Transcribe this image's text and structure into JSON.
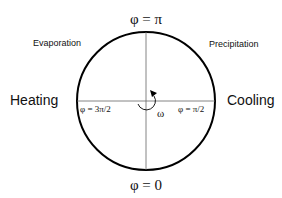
{
  "labels": {
    "top": "φ = π",
    "bottom": "φ = 0",
    "left_inner": "φ = 3π/2",
    "right_inner": "φ = π/2",
    "omega": "ω",
    "heating": "Heating",
    "cooling": "Cooling",
    "evaporation": "Evaporation",
    "precipitation": "Precipitation"
  }
}
